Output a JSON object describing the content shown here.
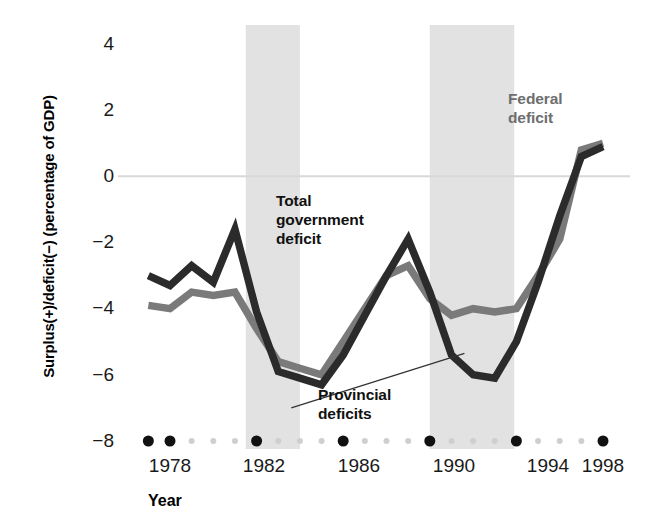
{
  "axis": {
    "y_title": "Surplus(+)/deficit(−) (percentage of GDP)",
    "x_title": "Year",
    "y_ticks": [
      "4",
      "2",
      "0",
      "−2",
      "−4",
      "−6",
      "−8"
    ],
    "x_ticks": [
      "1978",
      "1982",
      "1986",
      "1990",
      "1994",
      "1998"
    ]
  },
  "annotations": {
    "total": "Total\ngovernment\ndeficit",
    "total_line1": "Total",
    "total_line2": "government",
    "total_line3": "deficit",
    "provincial_line1": "Provincial",
    "provincial_line2": "deficits",
    "federal_line1": "Federal",
    "federal_line2": "deficit"
  },
  "colors": {
    "total_line": "#2b2b2b",
    "federal_line": "#7a7a7a",
    "recession_band": "#e2e2e2",
    "zero_line": "#d8d8d8",
    "tick_major": "#111111",
    "tick_minor": "#cfcfcf"
  },
  "chart_data": {
    "type": "line",
    "title": "",
    "xlabel": "Year",
    "ylabel": "Surplus(+)/deficit(−) (percentage of GDP)",
    "xlim": [
      1977,
      1998
    ],
    "ylim": [
      -8,
      4
    ],
    "grid": false,
    "legend": "annotations on plot",
    "x": [
      1977,
      1978,
      1979,
      1980,
      1981,
      1982,
      1983,
      1984,
      1985,
      1986,
      1987,
      1988,
      1989,
      1990,
      1991,
      1992,
      1993,
      1994,
      1995,
      1996,
      1997,
      1998
    ],
    "series": [
      {
        "name": "Total government deficit",
        "color": "#2b2b2b",
        "values": [
          -3.0,
          -3.3,
          -2.7,
          -3.2,
          -1.6,
          -4.1,
          -5.9,
          -6.1,
          -6.3,
          -5.4,
          -4.2,
          -3.0,
          -1.9,
          -3.5,
          -5.4,
          -6.0,
          -6.1,
          -5.0,
          -3.2,
          -1.2,
          0.6,
          0.9
        ]
      },
      {
        "name": "Federal deficit",
        "color": "#7a7a7a",
        "values": [
          -3.9,
          -4.0,
          -3.5,
          -3.6,
          -3.5,
          -4.6,
          -5.6,
          -5.8,
          -6.0,
          -5.0,
          -4.0,
          -3.0,
          -2.7,
          -3.7,
          -4.2,
          -4.0,
          -4.1,
          -4.0,
          -3.0,
          -1.9,
          0.8,
          1.0
        ]
      }
    ],
    "shaded_regions": [
      {
        "label": "recession",
        "x_start": 1981.5,
        "x_end": 1984.0
      },
      {
        "label": "recession",
        "x_start": 1990.0,
        "x_end": 1993.9
      }
    ],
    "reference_lines": [
      {
        "y": 0,
        "color": "#d8d8d8"
      }
    ],
    "x_minor_tick_interval": 1,
    "x_major_ticks": [
      1978,
      1982,
      1986,
      1990,
      1994,
      1998
    ],
    "y_ticks": [
      4,
      2,
      0,
      -2,
      -4,
      -6,
      -8
    ]
  }
}
